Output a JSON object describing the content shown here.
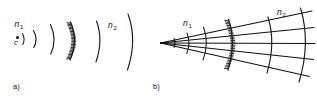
{
  "figure": {
    "background_color": "#ffffff",
    "ink_color": "#1a1a1a",
    "width": 317,
    "height": 101,
    "panels": [
      {
        "id": "a",
        "panel_label": "a)",
        "description": "point source with spherical wavefronts passing through curved grating",
        "labels": {
          "index_left_base": "n",
          "index_left_sub": "1",
          "index_right_base": "n",
          "index_right_sub": "2",
          "source_label": "c"
        },
        "wavefronts_before": 2,
        "wavefronts_after": 2,
        "grating_teeth": 26
      },
      {
        "id": "b",
        "panel_label": "b)",
        "description": "diverging ray fan from apex crossing curved grating with wavefront arcs",
        "labels": {
          "index_left_base": "n",
          "index_left_sub": "1",
          "index_right_base": "n",
          "index_right_sub": "2"
        },
        "rays": 5,
        "wavefronts_before": 3,
        "wavefronts_after": 2,
        "grating_teeth": 30
      }
    ]
  }
}
